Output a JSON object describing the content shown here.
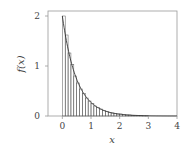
{
  "chart_data": {
    "type": "bar",
    "title": "",
    "xlabel": "x",
    "ylabel": "f(x)",
    "xlim": [
      -0.5,
      4
    ],
    "ylim": [
      0,
      2.1
    ],
    "xticks": [
      0,
      1,
      2,
      3,
      4
    ],
    "yticks": [
      0,
      1,
      2
    ],
    "grid": false,
    "legend": null,
    "bin_width": 0.1,
    "histogram": {
      "bin_edges": [
        0,
        0.1,
        0.2,
        0.3,
        0.4,
        0.5,
        0.6,
        0.7,
        0.8,
        0.9,
        1.0,
        1.1,
        1.2,
        1.3,
        1.4,
        1.5,
        1.6,
        1.7,
        1.8,
        1.9,
        2.0,
        2.1,
        2.2,
        2.3,
        2.4,
        2.5,
        2.6,
        2.7,
        2.8,
        2.9,
        3.0
      ],
      "values": [
        2.0,
        1.62,
        1.26,
        1.03,
        0.8,
        0.66,
        0.54,
        0.45,
        0.36,
        0.3,
        0.25,
        0.2,
        0.17,
        0.14,
        0.11,
        0.09,
        0.07,
        0.06,
        0.05,
        0.04,
        0.04,
        0.03,
        0.02,
        0.02,
        0.01,
        0.01,
        0.01,
        0.01,
        0.005,
        0.005
      ]
    },
    "series": [
      {
        "name": "density",
        "type": "line",
        "function": "2*exp(-2x)",
        "x_range": [
          0,
          4
        ]
      }
    ]
  },
  "colors": {
    "bar_stroke": "#555555",
    "curve": "#333333",
    "frame": "#888888",
    "text": "#444444"
  }
}
